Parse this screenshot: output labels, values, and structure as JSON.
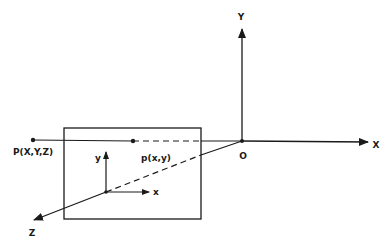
{
  "diagram": {
    "type": "pinhole-camera-projection",
    "colors": {
      "ink": "#1a1a1a",
      "background": "#ffffff"
    },
    "world_axes": {
      "origin_label": "O",
      "x_label": "X",
      "y_label": "Y",
      "z_label": "Z"
    },
    "image_plane_axes": {
      "x_label": "x",
      "y_label": "y"
    },
    "points": {
      "world_point_label": "P(X,Y,Z)",
      "image_point_label": "p(x,y)"
    }
  }
}
